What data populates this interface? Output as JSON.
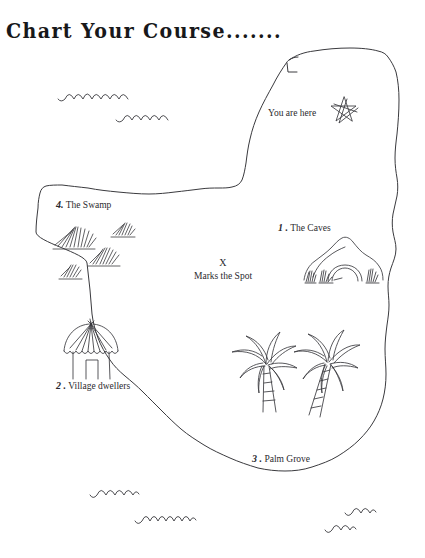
{
  "page": {
    "title": "Chart Your Course.......",
    "background_color": "#ffffff",
    "ink_color": "#3a3a3e",
    "text_color": "#2a2a2e"
  },
  "map": {
    "name": "treasure-island-map",
    "you_are_here": {
      "label": "You are here",
      "icon": "star-icon"
    },
    "treasure": {
      "mark": "X",
      "caption": "Marks the Spot"
    },
    "locations": [
      {
        "number": "1 .",
        "label": "The Caves",
        "icon": "cave-icon"
      },
      {
        "number": "2 .",
        "label": "Village dwellers",
        "icon": "hut-icon"
      },
      {
        "number": "3 .",
        "label": "Palm Grove",
        "icon": "palm-tree-icon"
      },
      {
        "number": "4.",
        "label": "The Swamp",
        "icon": "grass-tuft-icon"
      }
    ],
    "decorations": {
      "waves": "wave-icon",
      "wave_count": 6,
      "grass_tufts": 4,
      "palm_trees": 2
    }
  }
}
